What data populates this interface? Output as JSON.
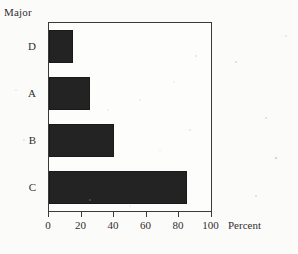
{
  "chart_data": {
    "type": "bar",
    "orientation": "horizontal",
    "title": "",
    "categories": [
      "D",
      "A",
      "B",
      "C"
    ],
    "values": [
      15,
      25,
      40,
      85
    ],
    "xlabel": "Percent",
    "ylabel": "Major",
    "xlim": [
      0,
      100
    ],
    "xticks": [
      0,
      20,
      40,
      60,
      80,
      100
    ],
    "xtick_labels": [
      "0",
      "20",
      "40",
      "60",
      "80",
      "100"
    ],
    "grid": false,
    "legend": null,
    "bar_color": "#232323",
    "frame_color": "#3a3a3a",
    "background_color": "#fbfbfa"
  },
  "axes": {
    "y_title": "Major",
    "x_title": "Percent"
  }
}
